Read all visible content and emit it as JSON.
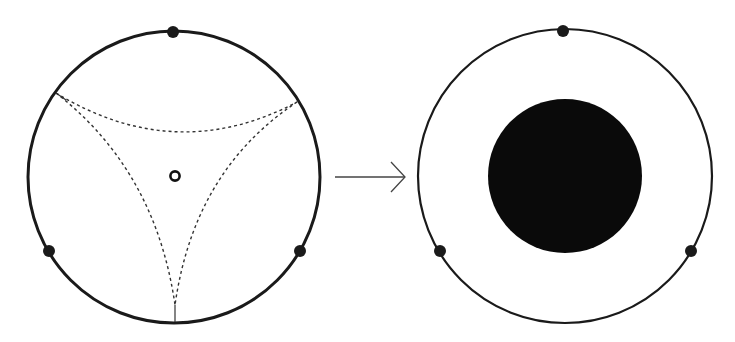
{
  "diagram": {
    "colors": {
      "stroke": "#1a1a1a",
      "fill": "#0a0a0a",
      "background": "#ffffff"
    },
    "left_disk": {
      "center": [
        174,
        177
      ],
      "radius": 146,
      "stroke_width": 3,
      "marked_points": [
        [
          173,
          32
        ],
        [
          49,
          251
        ],
        [
          300,
          251
        ]
      ],
      "puncture": {
        "center": [
          175,
          176
        ],
        "radius": 5,
        "stroke_width": 2.5
      },
      "ideal_vertices": [
        [
          56,
          93
        ],
        [
          297,
          102
        ],
        [
          175,
          322
        ]
      ]
    },
    "arrow": {
      "from": [
        335,
        177
      ],
      "to": [
        405,
        177
      ]
    },
    "right_disk": {
      "center": [
        565,
        176
      ],
      "radius": 147,
      "stroke_width": 2.2,
      "marked_points": [
        [
          563,
          31
        ],
        [
          440,
          251
        ],
        [
          691,
          251
        ]
      ],
      "filled_disk": {
        "center": [
          565,
          176
        ],
        "radius": 77
      }
    }
  }
}
